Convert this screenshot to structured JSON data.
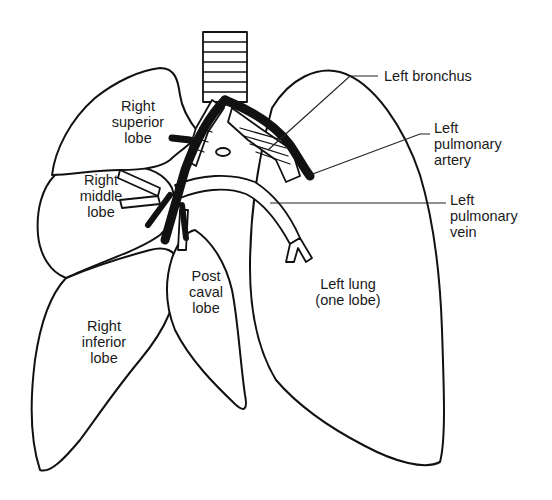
{
  "diagram": {
    "colors": {
      "line": "#111111",
      "background": "#ffffff"
    },
    "labels": {
      "right_superior_lobe": "Right\nsuperior\nlobe",
      "right_middle_lobe": "Right\nmiddle\nlobe",
      "right_inferior_lobe": "Right\ninferior\nlobe",
      "post_caval_lobe": "Post\ncaval\nlobe",
      "left_lung": "Left lung\n(one lobe)",
      "left_bronchus": "Left bronchus",
      "left_pulmonary_artery": "Left\npulmonary\nartery",
      "left_pulmonary_vein": "Left\npulmonary\nvein"
    }
  }
}
